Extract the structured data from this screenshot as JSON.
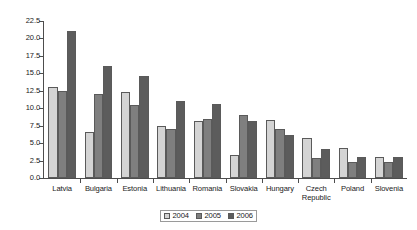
{
  "chart_data": {
    "type": "bar",
    "title": "",
    "subtitle": "",
    "xlabel": "",
    "ylabel": "",
    "ylim": [
      0.0,
      22.5
    ],
    "ytick_labels": [
      "22.5",
      "20.0",
      "17.5",
      "15.0",
      "12.5",
      "10.0",
      "7.5",
      "5.0",
      "2.5",
      "0.0"
    ],
    "ytick_values": [
      22.5,
      20.0,
      17.5,
      15.0,
      12.5,
      10.0,
      7.5,
      5.0,
      2.5,
      0.0
    ],
    "ytick_step": 2.5,
    "grid": false,
    "legend_position": "bottom-center",
    "categories": [
      "Latvia",
      "Bulgaria",
      "Estonia",
      "Lithuania",
      "Romania",
      "Slovakia",
      "Hungary",
      "Czech Republic",
      "Poland",
      "Slovenia"
    ],
    "series": [
      {
        "name": "2004",
        "color": "#d4d4d4",
        "values": [
          13.0,
          6.6,
          12.3,
          7.4,
          8.2,
          3.3,
          8.3,
          5.7,
          4.3,
          3.0
        ]
      },
      {
        "name": "2005",
        "color": "#7f7f7f",
        "values": [
          12.5,
          12.0,
          10.5,
          7.0,
          8.5,
          9.0,
          7.0,
          2.9,
          2.3,
          2.3
        ]
      },
      {
        "name": "2006",
        "color": "#5c5c5c",
        "values": [
          21.0,
          16.0,
          14.6,
          11.0,
          10.6,
          8.2,
          6.2,
          4.2,
          3.0,
          3.0
        ]
      }
    ]
  },
  "axis": {
    "line_color": "#4d4d4d"
  },
  "legend": {
    "entries": [
      "2004",
      "2005",
      "2006"
    ]
  }
}
